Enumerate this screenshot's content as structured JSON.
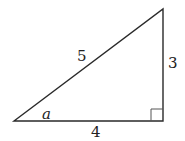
{
  "diagram": {
    "type": "right-triangle",
    "stroke_color": "#2a2a2a",
    "vertices": {
      "left": {
        "x": 14,
        "y": 121
      },
      "right_angle": {
        "x": 163,
        "y": 121
      },
      "top": {
        "x": 163,
        "y": 9
      }
    },
    "right_angle_marker": {
      "x": 151,
      "y": 109,
      "size": 12
    },
    "labels": {
      "hypotenuse": "5",
      "vertical_leg": "3",
      "horizontal_leg": "4",
      "angle": "a"
    }
  }
}
